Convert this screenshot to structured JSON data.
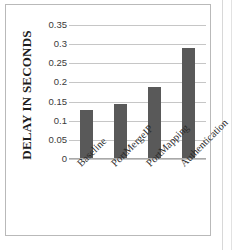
{
  "chart_data": {
    "type": "bar",
    "title": "",
    "xlabel": "",
    "ylabel": "DELAY IN SECONDS",
    "categories": [
      "Baseline",
      "PortMergeIP",
      "PortMapping",
      "Authentication"
    ],
    "values": [
      0.129,
      0.143,
      0.188,
      0.289
    ],
    "ylim": [
      0,
      0.35
    ],
    "y_ticks": [
      "0",
      "0.05",
      "0.1",
      "0.15",
      "0.2",
      "0.25",
      "0.3",
      "0.35"
    ],
    "y_tick_values": [
      0,
      0.05,
      0.1,
      0.15,
      0.2,
      0.25,
      0.3,
      0.35
    ],
    "grid": true,
    "legend": false,
    "legend_position": "none",
    "bar_color": "#595959",
    "gridline_color": "#c6c6c6",
    "background_color": "#ffffff"
  }
}
